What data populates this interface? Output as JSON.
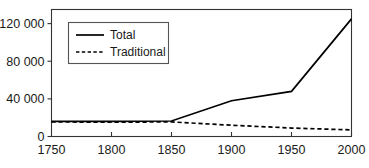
{
  "chart_data": {
    "type": "line",
    "title": "",
    "subtitle": "",
    "xlabel": "",
    "ylabel": "",
    "xlim": [
      1750,
      2000
    ],
    "ylim": [
      0,
      135000
    ],
    "grid": false,
    "legend_position": "top-left-inside",
    "x": [
      1750,
      1800,
      1850,
      1900,
      1950,
      2000
    ],
    "xtick_labels": [
      "1750",
      "1800",
      "1850",
      "1900",
      "1950",
      "2000"
    ],
    "ytick_values": [
      0,
      40000,
      80000,
      120000
    ],
    "ytick_labels": [
      "0",
      "40 000",
      "80 000",
      "120 000"
    ],
    "series": [
      {
        "name": "Total",
        "style": "solid",
        "color": "#000000",
        "values": [
          16000,
          16000,
          16500,
          38000,
          48000,
          125000
        ]
      },
      {
        "name": "Traditional",
        "style": "dashed",
        "color": "#000000",
        "values": [
          15500,
          15200,
          15500,
          12000,
          9000,
          7000
        ]
      }
    ]
  },
  "legend": {
    "entries": [
      {
        "label": "Total"
      },
      {
        "label": "Traditional"
      }
    ]
  }
}
